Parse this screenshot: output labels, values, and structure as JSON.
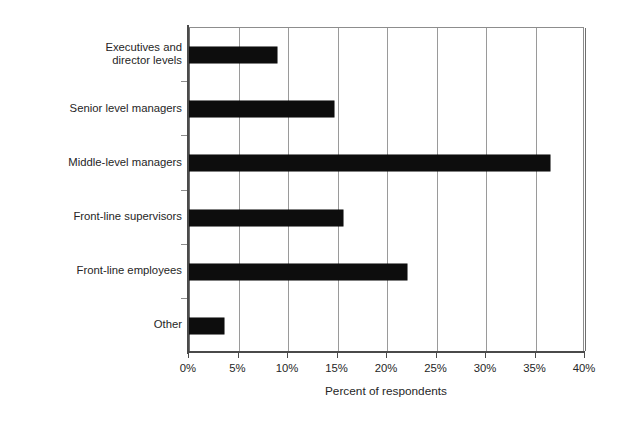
{
  "chart_data": {
    "type": "bar",
    "orientation": "horizontal",
    "title": "",
    "subtitle": "",
    "xlabel": "Percent of respondents",
    "ylabel": "",
    "categories": [
      "Executives and\ndirector levels",
      "Senior level managers",
      "Middle-level managers",
      "Front-line supervisors",
      "Front-line employees",
      "Other"
    ],
    "values": [
      8.9,
      14.6,
      36.5,
      15.6,
      22.0,
      3.5
    ],
    "value_unit": "%",
    "xlim": [
      0,
      40
    ],
    "xtick_values": [
      0,
      5,
      10,
      15,
      20,
      25,
      30,
      35,
      40
    ],
    "xtick_labels": [
      "0%",
      "5%",
      "10%",
      "15%",
      "20%",
      "25%",
      "30%",
      "35%",
      "40%"
    ],
    "grid": "vertical",
    "legend": "none",
    "bar_color": "#0d0d0d",
    "grid_color": "#9a9a9a",
    "axis_color": "#4a4a4a",
    "text_color": "#262626",
    "background_color": "#ffffff"
  }
}
